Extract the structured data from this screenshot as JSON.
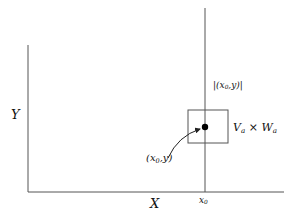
{
  "diagram": {
    "axes": {
      "y_label": "Y",
      "x_label": "X"
    },
    "vertical_line": {
      "tick_label_main": "x",
      "tick_label_sub": "0",
      "line_label_open": "|(x",
      "line_label_sub": "0",
      "line_label_close": ",y)|"
    },
    "window": {
      "label_v": "V",
      "label_v_sub": "a",
      "times": "×",
      "label_w": "W",
      "label_w_sub": "a"
    },
    "point": {
      "label_open": "(x",
      "label_sub": "0",
      "label_close": ",y)"
    },
    "colors": {
      "line": "#555555",
      "dot": "#000000",
      "text": "#111111"
    }
  }
}
